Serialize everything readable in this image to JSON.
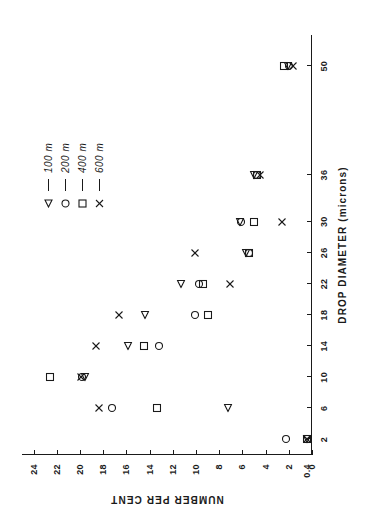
{
  "chart_data": {
    "type": "scatter",
    "title": "",
    "xlabel": "DROP DIAMETER (microns)",
    "ylabel": "NUMBER PER CENT",
    "xtick_labels": [
      "2",
      "6",
      "10",
      "14",
      "18",
      "22",
      "26",
      "30",
      "36",
      "50"
    ],
    "xtick_values": [
      2,
      6,
      10,
      14,
      18,
      22,
      26,
      30,
      36,
      50
    ],
    "ytick_labels": [
      "0",
      "0.4",
      "2",
      "4",
      "6",
      "8",
      "10",
      "12",
      "14",
      "16",
      "18",
      "20",
      "22",
      "24"
    ],
    "ytick_values": [
      0,
      0.4,
      2,
      4,
      6,
      8,
      10,
      12,
      14,
      16,
      18,
      20,
      22,
      24
    ],
    "xlim": [
      0,
      54
    ],
    "ylim": [
      0,
      25
    ],
    "grid": false,
    "legend_position": "upper-right-inside",
    "series": [
      {
        "name": "100 m",
        "marker": "triangle-left",
        "x": [
          2,
          6,
          10,
          14,
          18,
          22,
          26,
          30,
          36,
          50
        ],
        "y": [
          0.4,
          7.2,
          19.6,
          15.9,
          14.4,
          11.3,
          5.7,
          6.2,
          5.0,
          2.1
        ]
      },
      {
        "name": "200 m",
        "marker": "circle",
        "x": [
          2,
          6,
          10,
          14,
          18,
          22,
          26,
          30,
          36,
          50
        ],
        "y": [
          2.2,
          17.2,
          19.8,
          13.2,
          10.1,
          9.7,
          5.4,
          6.1,
          4.7,
          2.0
        ]
      },
      {
        "name": "400 m",
        "marker": "square",
        "x": [
          2,
          6,
          10,
          14,
          18,
          22,
          26,
          30,
          36,
          50
        ],
        "y": [
          0.4,
          13.4,
          22.6,
          14.5,
          9.0,
          9.4,
          5.4,
          5.0,
          4.7,
          2.4
        ]
      },
      {
        "name": "600 m",
        "marker": "cross",
        "x": [
          2,
          6,
          10,
          14,
          18,
          22,
          26,
          30,
          36,
          50
        ],
        "y": [
          0.4,
          18.4,
          19.9,
          18.6,
          16.6,
          7.1,
          10.1,
          2.6,
          4.5,
          1.6
        ]
      }
    ]
  },
  "legend": {
    "entries": [
      {
        "label": "100 m",
        "marker": "triangle-left"
      },
      {
        "label": "200 m",
        "marker": "circle"
      },
      {
        "label": "400 m",
        "marker": "square"
      },
      {
        "label": "600 m",
        "marker": "cross"
      }
    ]
  },
  "colors": {
    "ink": "#1a1a1a",
    "background": "#ffffff"
  }
}
